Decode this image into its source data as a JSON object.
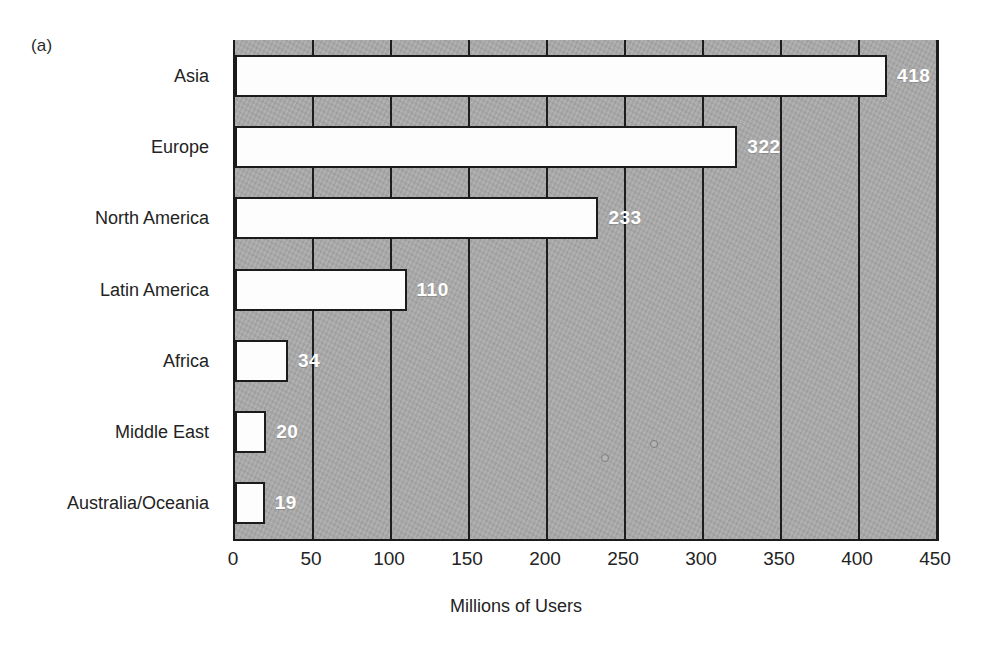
{
  "figure": {
    "panel_label": "(a)",
    "background_color": "#ffffff",
    "plot_background_color": "#a9a9a9",
    "bar_fill_color": "#fdfdfd",
    "bar_outline_color": "#1b1b1b",
    "value_label_color": "#ffffff",
    "axis_color": "#1a1a1a"
  },
  "chart_data": {
    "type": "bar",
    "orientation": "horizontal",
    "title": "",
    "subtitle": "",
    "xlabel": "Millions of Users",
    "ylabel": "",
    "categories": [
      "Asia",
      "Europe",
      "North America",
      "Latin America",
      "Africa",
      "Middle East",
      "Australia/Oceania"
    ],
    "values": [
      418,
      322,
      233,
      110,
      34,
      20,
      19
    ],
    "data_labels": [
      "418",
      "322",
      "233",
      "110",
      "34",
      "20",
      "19"
    ],
    "xlim": [
      0,
      450
    ],
    "xticks": [
      0,
      50,
      100,
      150,
      200,
      250,
      300,
      350,
      400,
      450
    ],
    "xtick_labels": [
      "0",
      "50",
      "100",
      "150",
      "200",
      "250",
      "300",
      "350",
      "400",
      "450"
    ],
    "grid": "vertical",
    "legend": "none",
    "annotations": [
      "(a)"
    ]
  }
}
